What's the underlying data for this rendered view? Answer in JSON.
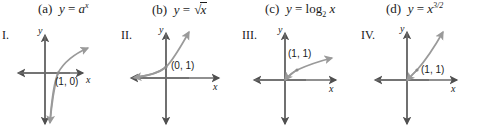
{
  "functions": [
    {
      "tag": "(a)",
      "lhs": "y",
      "eq": "=",
      "base": "a",
      "exp": "x",
      "kind": "power",
      "full_text": "(a) y = a^x"
    },
    {
      "tag": "(b)",
      "lhs": "y",
      "eq": "=",
      "base": "x",
      "exp": "",
      "kind": "radical",
      "full_text": "(b) y = √x"
    },
    {
      "tag": "(c)",
      "lhs": "y",
      "eq": "=",
      "base": "log",
      "sub": "2",
      "arg": "x",
      "kind": "log",
      "full_text": "(c) y = log₂ x"
    },
    {
      "tag": "(d)",
      "lhs": "y",
      "eq": "=",
      "base": "x",
      "exp": "3/2",
      "kind": "power",
      "full_text": "(d) y = x^(3/2)"
    }
  ],
  "graphs": [
    {
      "roman": "I.",
      "point_label": "(1, 0)",
      "x_axis_label": "x",
      "y_axis_label": "y",
      "curve_type": "logarithmic",
      "passes_through": "(1, 0)"
    },
    {
      "roman": "II.",
      "point_label": "(0, 1)",
      "x_axis_label": "x",
      "y_axis_label": "y",
      "curve_type": "exponential",
      "passes_through": "(0, 1)"
    },
    {
      "roman": "III.",
      "point_label": "(1, 1)",
      "x_axis_label": "x",
      "y_axis_label": "y",
      "curve_type": "square-root",
      "passes_through": "(1, 1)"
    },
    {
      "roman": "IV.",
      "point_label": "(1, 1)",
      "x_axis_label": "x",
      "y_axis_label": "y",
      "curve_type": "power-three-halves",
      "passes_through": "(1, 1)"
    }
  ],
  "style": {
    "axis_color": "#6b6b6b",
    "curve_color": "#8a8a8a",
    "text_color": "#1a1a1a"
  }
}
